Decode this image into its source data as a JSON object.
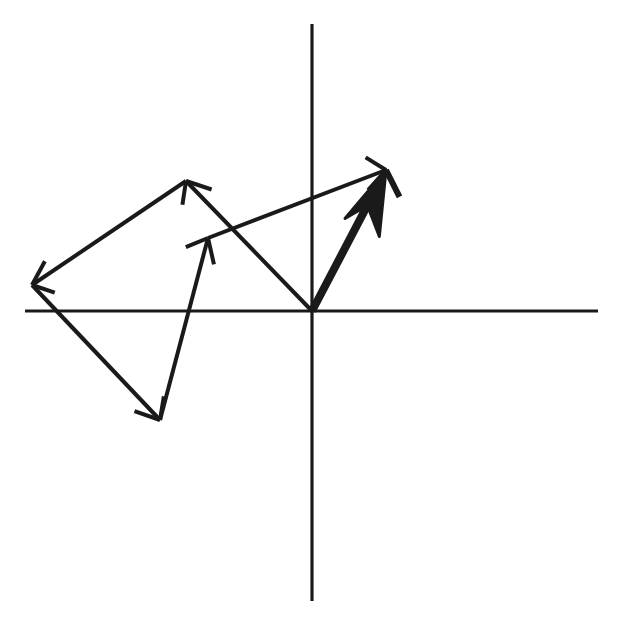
{
  "figure": {
    "width": 618,
    "height": 631,
    "background_color": "#ffffff",
    "ink_color": "#1a1a1a"
  },
  "axes": {
    "origin": {
      "x": 312,
      "y": 311
    },
    "x_axis": {
      "x1": 25,
      "y1": 311,
      "x2": 598,
      "y2": 311,
      "stroke_width": 3.2
    },
    "y_axis": {
      "x1": 312,
      "y1": 24,
      "x2": 312,
      "y2": 601,
      "stroke_width": 3.2
    }
  },
  "chart_data": {
    "type": "scatter",
    "xlabel": "",
    "ylabel": "",
    "grid": false,
    "legend": null,
    "origin_px": {
      "x": 312,
      "y": 311
    },
    "axis_ranges_px": {
      "x": [
        25,
        598
      ],
      "y": [
        24,
        601
      ]
    },
    "vectors": [
      {
        "name": "vector-a",
        "role": "component",
        "style": "thin",
        "start_px": {
          "x": 312,
          "y": 311
        },
        "end_px": {
          "x": 186,
          "y": 181
        },
        "components_px": {
          "dx": -126,
          "dy": -130
        },
        "stroke_width": 4,
        "arrowhead": "open-barbed"
      },
      {
        "name": "vector-b",
        "role": "component",
        "style": "thin",
        "start_px": {
          "x": 186,
          "y": 181
        },
        "end_px": {
          "x": 32,
          "y": 285
        },
        "components_px": {
          "dx": -154,
          "dy": 104
        },
        "stroke_width": 4,
        "arrowhead": "open-barbed"
      },
      {
        "name": "vector-c",
        "role": "component",
        "style": "thin",
        "start_px": {
          "x": 32,
          "y": 285
        },
        "end_px": {
          "x": 160,
          "y": 420
        },
        "components_px": {
          "dx": 128,
          "dy": 135
        },
        "stroke_width": 4,
        "arrowhead": "open-barbed"
      },
      {
        "name": "vector-d",
        "role": "component",
        "style": "thin",
        "start_px": {
          "x": 160,
          "y": 420
        },
        "end_px": {
          "x": 208,
          "y": 238
        },
        "components_px": {
          "dx": 48,
          "dy": -182
        },
        "stroke_width": 4,
        "arrowhead": "open-barbed"
      },
      {
        "name": "vector-closure",
        "role": "closure",
        "style": "thin",
        "start_px": {
          "x": 208,
          "y": 238
        },
        "end_px": {
          "x": 386,
          "y": 170
        },
        "components_px": {
          "dx": 178,
          "dy": -68
        },
        "stroke_width": 4,
        "arrowhead": "open-barbed"
      },
      {
        "name": "vector-resultant",
        "role": "resultant",
        "style": "thick",
        "start_px": {
          "x": 312,
          "y": 311
        },
        "end_px": {
          "x": 386,
          "y": 170
        },
        "components_px": {
          "dx": 74,
          "dy": -141
        },
        "stroke_width": 8,
        "arrowhead": "solid-filled"
      }
    ]
  }
}
